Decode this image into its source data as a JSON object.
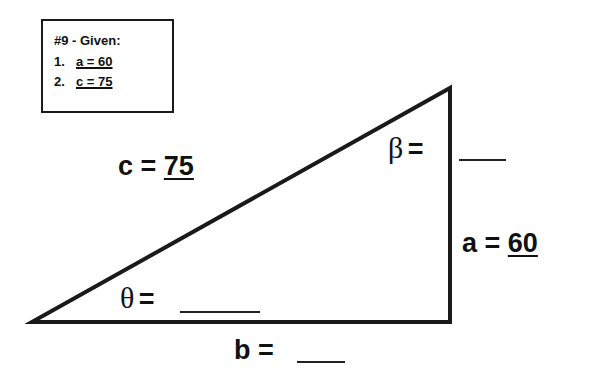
{
  "given": {
    "title": "#9 - Given:",
    "items": [
      {
        "num": "1.",
        "value": "a = 60"
      },
      {
        "num": "2.",
        "value": "c = 75"
      }
    ]
  },
  "triangle": {
    "vertices": {
      "left": [
        32,
        322
      ],
      "top_right": [
        450,
        88
      ],
      "bottom_right": [
        450,
        322
      ]
    },
    "stroke_color": "#1a1a1a"
  },
  "labels": {
    "c": {
      "name": "c =",
      "value": "75"
    },
    "a": {
      "name": "a =",
      "value": "60"
    },
    "b": {
      "name": "b =",
      "value": ""
    },
    "beta": {
      "symbol": "β",
      "eq": "=",
      "value": ""
    },
    "theta": {
      "symbol": "θ",
      "eq": "=",
      "value": ""
    }
  }
}
